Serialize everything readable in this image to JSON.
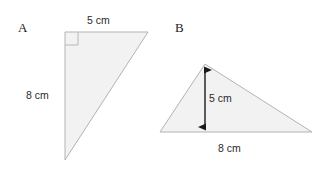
{
  "figure": {
    "background_color": "#ffffff",
    "shape_fill": "#f2f2f2",
    "shape_stroke": "#b3b3b3",
    "arrow_color": "#1a1a1a",
    "text_color": "#2b2b2b"
  },
  "shapes": [
    {
      "id": "A",
      "label": "A",
      "type": "right-triangle",
      "has_right_angle_marker": true,
      "right_angle_vertex": "top-left",
      "dimensions": [
        {
          "name": "top-side",
          "value": "5 cm",
          "number": 5,
          "unit": "cm",
          "orientation": "horizontal",
          "position": "above-top-edge"
        },
        {
          "name": "left-side",
          "value": "8 cm",
          "number": 8,
          "unit": "cm",
          "orientation": "vertical",
          "position": "left-of-vertical-edge"
        }
      ]
    },
    {
      "id": "B",
      "label": "B",
      "type": "scalene-triangle",
      "has_right_angle_marker": false,
      "dimensions": [
        {
          "name": "height",
          "value": "5 cm",
          "number": 5,
          "unit": "cm",
          "orientation": "vertical",
          "position": "interior-double-arrow"
        },
        {
          "name": "base",
          "value": "8 cm",
          "number": 8,
          "unit": "cm",
          "orientation": "horizontal",
          "position": "below-base"
        }
      ]
    }
  ]
}
